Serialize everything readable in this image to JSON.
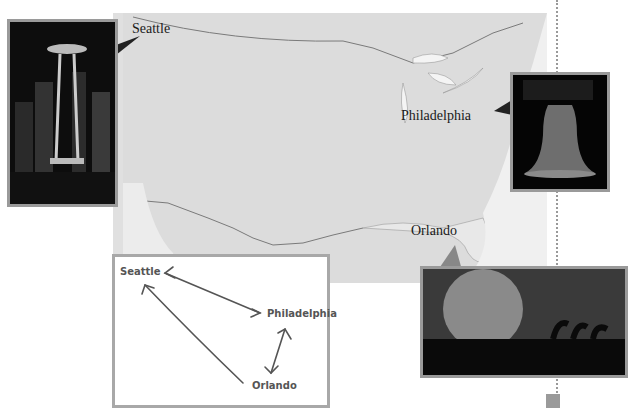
{
  "map": {
    "labels": {
      "seattle": "Seattle",
      "philadelphia": "Philadelphia",
      "orlando": "Orlando"
    }
  },
  "photos": [
    {
      "name": "seattle-space-needle-photo",
      "subject": "Space Needle skyline at night"
    },
    {
      "name": "philadelphia-liberty-bell-photo",
      "subject": "Liberty Bell"
    },
    {
      "name": "orlando-epcot-sphere-photo",
      "subject": "Epcot Spaceship Earth at dusk"
    }
  ],
  "diagram": {
    "nodes": {
      "seattle": "Seattle",
      "philadelphia": "Philadelphia",
      "orlando": "Orlando"
    },
    "edges": [
      {
        "from": "Seattle",
        "to": "Philadelphia",
        "direction": "both"
      },
      {
        "from": "Philadelphia",
        "to": "Orlando",
        "direction": "both"
      },
      {
        "from": "Orlando",
        "to": "Seattle",
        "direction": "to-Seattle"
      }
    ]
  },
  "colors": {
    "map_land": "#e2e2e2",
    "frame": "#9a9a9a",
    "text": "#1a1a1a"
  }
}
